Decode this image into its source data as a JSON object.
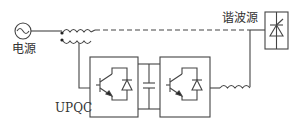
{
  "diagram": {
    "type": "circuit",
    "labels": {
      "source": "电源",
      "harmonic_source": "谐波源",
      "device": "UPQC"
    },
    "components": [
      {
        "id": "ac-source",
        "kind": "ac voltage source"
      },
      {
        "id": "series-transformer",
        "kind": "coupled inductor / transformer"
      },
      {
        "id": "converter-left",
        "kind": "IGBT with antiparallel diode"
      },
      {
        "id": "dc-capacitor",
        "kind": "capacitor"
      },
      {
        "id": "converter-right",
        "kind": "IGBT with antiparallel diode"
      },
      {
        "id": "output-inductor",
        "kind": "inductor"
      },
      {
        "id": "harmonic-load",
        "kind": "thyristor load"
      }
    ],
    "line_color": "#444444"
  }
}
